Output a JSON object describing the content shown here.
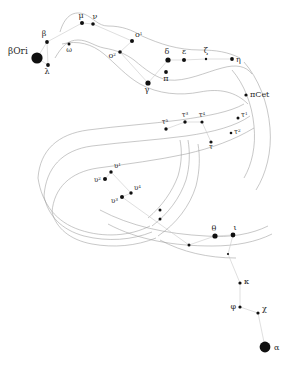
{
  "chart": {
    "type": "star-chart",
    "width": 287,
    "height": 368,
    "background_color": "#ffffff",
    "star_color": "#101010",
    "label_color": "#2a2a2a",
    "boundary_color": "#9a9a9a",
    "link_color": "#c9c9c9"
  },
  "stars": [
    {
      "id": "beta-ori",
      "label": "βOri",
      "x": 37,
      "y": 58,
      "r": 5.6,
      "label_dx": -29,
      "label_dy": -4,
      "label_size": 9,
      "anchor": "start"
    },
    {
      "id": "beta",
      "label": "β",
      "x": 47,
      "y": 42,
      "r": 1.9,
      "label_dx": -3,
      "label_dy": -6,
      "label_size": 8,
      "anchor": "middle"
    },
    {
      "id": "lambda",
      "label": "λ",
      "x": 48,
      "y": 65,
      "r": 1.9,
      "label_dx": -1,
      "label_dy": 9,
      "label_size": 8,
      "anchor": "middle"
    },
    {
      "id": "omega",
      "label": "ω",
      "x": 69,
      "y": 44,
      "r": 1.5,
      "label_dx": 0,
      "label_dy": 8,
      "label_size": 7,
      "anchor": "middle"
    },
    {
      "id": "mu",
      "label": "μ",
      "x": 82,
      "y": 23,
      "r": 2.0,
      "label_dx": -1,
      "label_dy": -5,
      "label_size": 8,
      "anchor": "middle"
    },
    {
      "id": "nu",
      "label": "ν",
      "x": 93,
      "y": 24,
      "r": 1.8,
      "label_dx": 2,
      "label_dy": -5,
      "label_size": 8,
      "anchor": "middle"
    },
    {
      "id": "xi2",
      "label": "o",
      "sup": "1",
      "x": 132,
      "y": 41,
      "r": 2.0,
      "label_dx": 3,
      "label_dy": -4,
      "label_size": 8,
      "anchor": "start"
    },
    {
      "id": "xi1",
      "label": "o",
      "sup": "2",
      "x": 120,
      "y": 52,
      "r": 1.8,
      "label_dx": -4,
      "label_dy": 6,
      "label_size": 8,
      "anchor": "end"
    },
    {
      "id": "gamma",
      "label": "γ",
      "x": 148,
      "y": 83,
      "r": 2.6,
      "label_dx": -1,
      "label_dy": 9,
      "label_size": 8,
      "anchor": "middle"
    },
    {
      "id": "pi",
      "label": "π",
      "x": 166,
      "y": 72,
      "r": 1.9,
      "label_dx": 0,
      "label_dy": 9,
      "label_size": 8,
      "anchor": "middle"
    },
    {
      "id": "delta",
      "label": "δ",
      "x": 168,
      "y": 60,
      "r": 2.6,
      "label_dx": -1,
      "label_dy": -6,
      "label_size": 8,
      "anchor": "middle"
    },
    {
      "id": "epsilon",
      "label": "ε",
      "x": 184,
      "y": 60,
      "r": 2.0,
      "label_dx": 0,
      "label_dy": -6,
      "label_size": 8,
      "anchor": "middle"
    },
    {
      "id": "zeta",
      "label": "ζ",
      "x": 206,
      "y": 59,
      "r": 1.2,
      "label_dx": 0,
      "label_dy": -6,
      "label_size": 8,
      "anchor": "middle"
    },
    {
      "id": "eta",
      "label": "η",
      "x": 232,
      "y": 59,
      "r": 1.9,
      "label_dx": 4,
      "label_dy": 3,
      "label_size": 8,
      "anchor": "start"
    },
    {
      "id": "pi-cet",
      "label": "πCet",
      "x": 246,
      "y": 95,
      "r": 1.6,
      "label_dx": 4,
      "label_dy": 2,
      "label_size": 8,
      "anchor": "start"
    },
    {
      "id": "tau1",
      "label": "τ",
      "sup": "1",
      "x": 238,
      "y": 118,
      "r": 1.5,
      "label_dx": 3,
      "label_dy": -1,
      "label_size": 7,
      "anchor": "start"
    },
    {
      "id": "tau2",
      "label": "τ",
      "sup": "2",
      "x": 231,
      "y": 133,
      "r": 1.3,
      "label_dx": 3,
      "label_dy": 1,
      "label_size": 7,
      "anchor": "start"
    },
    {
      "id": "tau3",
      "label": "τ",
      "sup": "3",
      "x": 185,
      "y": 122,
      "r": 1.7,
      "label_dx": 0,
      "label_dy": -5,
      "label_size": 7,
      "anchor": "middle"
    },
    {
      "id": "tau4",
      "label": "τ",
      "sup": "4",
      "x": 202,
      "y": 122,
      "r": 1.6,
      "label_dx": 0,
      "label_dy": -5,
      "label_size": 7,
      "anchor": "middle"
    },
    {
      "id": "tau5",
      "label": "τ",
      "sup": "5",
      "x": 166,
      "y": 129,
      "r": 1.7,
      "label_dx": -1,
      "label_dy": -5,
      "label_size": 7,
      "anchor": "middle"
    },
    {
      "id": "tau6",
      "label": "τ",
      "x": 211,
      "y": 142,
      "r": 1.6,
      "label_dx": 0,
      "label_dy": 7,
      "label_size": 7,
      "anchor": "middle"
    },
    {
      "id": "ups1",
      "label": "υ",
      "sup": "1",
      "x": 111,
      "y": 172,
      "r": 1.7,
      "label_dx": 3,
      "label_dy": -4,
      "label_size": 7,
      "anchor": "start"
    },
    {
      "id": "ups2",
      "label": "υ",
      "sup": "2",
      "x": 105,
      "y": 179,
      "r": 2.0,
      "label_dx": -4,
      "label_dy": 3,
      "label_size": 7,
      "anchor": "end"
    },
    {
      "id": "ups3",
      "label": "υ",
      "sup": "3",
      "x": 122,
      "y": 197,
      "r": 2.0,
      "label_dx": -4,
      "label_dy": 6,
      "label_size": 7,
      "anchor": "end"
    },
    {
      "id": "ups4",
      "label": "υ",
      "sup": "4",
      "x": 131,
      "y": 193,
      "r": 1.7,
      "label_dx": 3,
      "label_dy": -3,
      "label_size": 7,
      "anchor": "start"
    },
    {
      "id": "unl-1",
      "label": "",
      "x": 160,
      "y": 210,
      "r": 1.5,
      "label_dx": 0,
      "label_dy": 0,
      "label_size": 7,
      "anchor": "middle"
    },
    {
      "id": "unl-2",
      "label": "",
      "x": 160,
      "y": 219,
      "r": 1.5,
      "label_dx": 0,
      "label_dy": 0,
      "label_size": 7,
      "anchor": "middle"
    },
    {
      "id": "unl-3",
      "label": "",
      "x": 189,
      "y": 245,
      "r": 1.5,
      "label_dx": 0,
      "label_dy": 0,
      "label_size": 7,
      "anchor": "middle"
    },
    {
      "id": "theta",
      "label": "θ",
      "x": 215,
      "y": 236,
      "r": 2.6,
      "label_dx": -1,
      "label_dy": -5,
      "label_size": 8,
      "anchor": "middle"
    },
    {
      "id": "iota",
      "label": "ι",
      "x": 233,
      "y": 235,
      "r": 2.4,
      "label_dx": 2,
      "label_dy": -5,
      "label_size": 8,
      "anchor": "middle"
    },
    {
      "id": "unl-4",
      "label": "",
      "x": 228,
      "y": 254,
      "r": 1.1,
      "label_dx": 0,
      "label_dy": 0,
      "label_size": 7,
      "anchor": "middle"
    },
    {
      "id": "kappa",
      "label": "κ",
      "x": 240,
      "y": 283,
      "r": 1.6,
      "label_dx": 4,
      "label_dy": 1,
      "label_size": 8,
      "anchor": "start"
    },
    {
      "id": "phi",
      "label": "φ",
      "x": 240,
      "y": 307,
      "r": 1.6,
      "label_dx": -4,
      "label_dy": 2,
      "label_size": 8,
      "anchor": "end"
    },
    {
      "id": "chi",
      "label": "χ",
      "x": 258,
      "y": 313,
      "r": 1.6,
      "label_dx": 4,
      "label_dy": -2,
      "label_size": 8,
      "anchor": "start"
    },
    {
      "id": "alpha",
      "label": "α",
      "x": 265,
      "y": 347,
      "r": 5.4,
      "label_dx": 9,
      "label_dy": 3,
      "label_size": 8,
      "anchor": "start"
    }
  ],
  "links": [
    {
      "from": "beta-ori",
      "to": "beta"
    },
    {
      "from": "beta-ori",
      "to": "lambda"
    },
    {
      "from": "beta",
      "to": "lambda"
    },
    {
      "from": "beta",
      "to": "mu"
    },
    {
      "from": "mu",
      "to": "nu"
    },
    {
      "from": "nu",
      "to": "xi2"
    },
    {
      "from": "xi2",
      "to": "xi1"
    },
    {
      "from": "xi1",
      "to": "gamma"
    },
    {
      "from": "gamma",
      "to": "delta"
    },
    {
      "from": "delta",
      "to": "epsilon"
    },
    {
      "from": "epsilon",
      "to": "zeta"
    },
    {
      "from": "zeta",
      "to": "eta"
    },
    {
      "from": "tau5",
      "to": "tau3"
    },
    {
      "from": "tau3",
      "to": "tau4"
    },
    {
      "from": "tau4",
      "to": "tau6"
    },
    {
      "from": "ups2",
      "to": "ups1"
    },
    {
      "from": "ups1",
      "to": "ups4"
    },
    {
      "from": "ups4",
      "to": "ups3"
    },
    {
      "from": "ups3",
      "to": "unl-3"
    },
    {
      "from": "unl-3",
      "to": "theta"
    },
    {
      "from": "theta",
      "to": "iota"
    },
    {
      "from": "iota",
      "to": "unl-4"
    },
    {
      "from": "unl-4",
      "to": "kappa"
    },
    {
      "from": "kappa",
      "to": "phi"
    },
    {
      "from": "phi",
      "to": "chi"
    },
    {
      "from": "chi",
      "to": "alpha"
    }
  ],
  "boundaries": [
    {
      "id": "head-upper",
      "d": "M 60 32 C 64 18 72 10 84 14 C 94 18 98 26 108 26 C 122 26 132 30 142 36"
    },
    {
      "id": "head-lower",
      "d": "M 55 58 C 62 46 68 40 78 40 C 88 40 94 46 104 48 C 116 50 126 54 134 60"
    },
    {
      "id": "neck-upper",
      "d": "M 142 36 C 160 44 178 50 200 50 C 216 50 228 52 240 58"
    },
    {
      "id": "neck-lower",
      "d": "M 134 60 C 146 70 156 78 168 80 C 186 82 206 72 222 68 C 236 64 246 66 252 74"
    },
    {
      "id": "body-top",
      "d": "M 62 44 C 78 40 92 44 104 54 C 116 64 126 76 140 84 C 158 94 180 96 200 92 C 220 88 236 92 248 104"
    },
    {
      "id": "body-arc-1",
      "d": "M 38 178 C 40 150 58 134 88 130 C 118 126 150 124 180 120 C 208 116 230 112 244 104"
    },
    {
      "id": "body-arc-2",
      "d": "M 44 196 C 46 168 62 150 92 146 C 124 142 156 140 186 136 C 214 132 236 126 250 116"
    },
    {
      "id": "body-arc-3",
      "d": "M 52 212 C 54 188 70 172 98 168 C 128 164 158 160 186 154 C 212 148 234 140 254 128"
    },
    {
      "id": "tail-arc-1",
      "d": "M 38 178 C 42 204 56 222 80 230 C 104 238 130 236 150 226"
    },
    {
      "id": "tail-arc-2",
      "d": "M 44 196 C 48 216 62 230 84 236 C 108 242 132 240 152 232"
    },
    {
      "id": "tail-arc-3",
      "d": "M 52 212 C 56 228 70 240 92 244 C 114 248 136 246 156 238"
    },
    {
      "id": "fin-inner",
      "d": "M 152 226 C 168 214 180 198 186 180 C 190 166 190 152 188 140"
    },
    {
      "id": "fin-outer",
      "d": "M 158 236 C 176 224 190 206 196 186 C 200 170 200 156 198 144"
    },
    {
      "id": "fin-mid",
      "d": "M 148 218 C 162 206 172 192 178 176 C 182 162 182 150 180 140"
    },
    {
      "id": "tail-fin-upper",
      "d": "M 232 70 C 244 84 252 104 254 126 C 256 146 252 164 244 178"
    },
    {
      "id": "tail-fin-lower",
      "d": "M 244 62 C 258 78 268 102 270 128 C 272 152 266 174 256 190"
    },
    {
      "id": "body-sweep",
      "d": "M 100 210 C 130 226 166 234 206 236 C 230 238 252 234 268 226"
    },
    {
      "id": "body-sweep-2",
      "d": "M 108 224 C 138 240 174 246 212 246 C 236 246 256 242 272 234"
    },
    {
      "id": "lower-arc",
      "d": "M 160 240 C 182 252 208 258 236 258"
    }
  ]
}
